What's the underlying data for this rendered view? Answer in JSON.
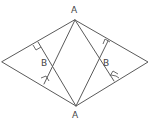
{
  "diagram": {
    "type": "geometry",
    "colors": {
      "line": "#5a5a5a",
      "label": "#444444",
      "background": "#ffffff"
    },
    "labels": {
      "top_vertex": "A",
      "bottom_vertex": "A",
      "left_intersection": "B",
      "right_intersection": "B"
    },
    "points": {
      "top": [
        75,
        20
      ],
      "bottom": [
        76,
        106
      ],
      "left": [
        2,
        62
      ],
      "right": [
        148,
        62
      ],
      "b_left": [
        50,
        62
      ],
      "b_right": [
        101,
        62
      ],
      "foot_left_upper": [
        38,
        42
      ],
      "foot_left_lower": [
        44,
        84
      ],
      "foot_right_upper": [
        108,
        41
      ],
      "foot_right_lower": [
        114,
        81
      ]
    },
    "right_angle_markers": 4
  }
}
